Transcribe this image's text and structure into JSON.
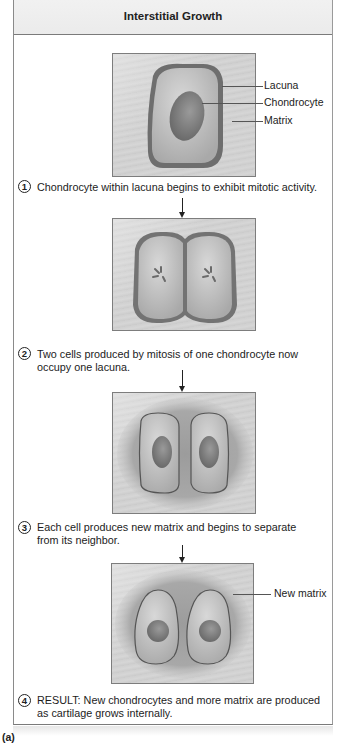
{
  "title": "Interstitial Growth",
  "figure_label": "(a)",
  "labels": {
    "lacuna": "Lacuna",
    "chondrocyte": "Chondrocyte",
    "matrix": "Matrix",
    "new_matrix": "New matrix"
  },
  "steps": [
    {
      "number": "1",
      "text": "Chondrocyte within lacuna begins to exhibit mitotic activity."
    },
    {
      "number": "2",
      "line1": "Two cells produced by mitosis of one chondrocyte now",
      "line2": "occupy one lacuna."
    },
    {
      "number": "3",
      "line1": "Each cell produces new matrix and begins to separate",
      "line2": "from its neighbor."
    },
    {
      "number": "4",
      "line1": "RESULT: New chondrocytes and more matrix are produced",
      "line2": "as cartilage grows internally."
    }
  ],
  "colors": {
    "frame_border": "#7a7a7a",
    "header_bg": "#eeeeee",
    "panel_bg": "#d0d0d0",
    "lacuna_edge": "#6e6e6e",
    "cell": "#bdbdbd",
    "nucleus": "#8a8a8a"
  }
}
